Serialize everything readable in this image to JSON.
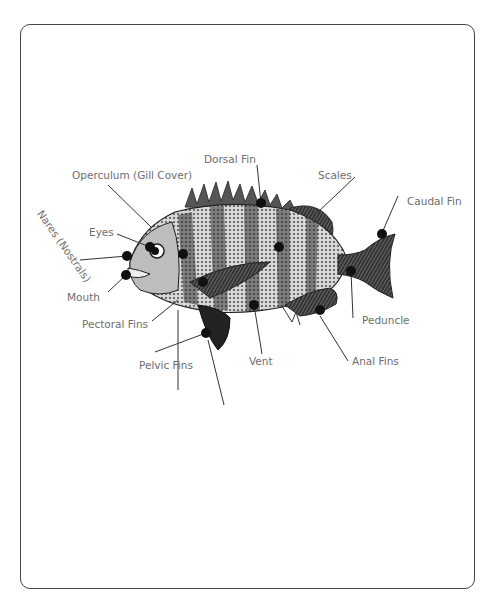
{
  "diagram": {
    "labels": {
      "operculum": "Operculum (Gill Cover)",
      "dorsal_fin": "Dorsal Fin",
      "scales": "Scales",
      "caudal_fin": "Caudal Fin",
      "eyes": "Eyes",
      "nares": "Nares (Nostrals)",
      "mouth": "Mouth",
      "pectoral_fins": "Pectoral Fins",
      "pelvic_fins": "Pelvic Fins",
      "vent": "Vent",
      "anal_fins": "Anal Fins",
      "peduncle": "Peduncle"
    },
    "colors": {
      "frame": "#444444",
      "label_text": "#6e6e6e",
      "leader_line": "#333333",
      "marker": "#111111"
    }
  }
}
